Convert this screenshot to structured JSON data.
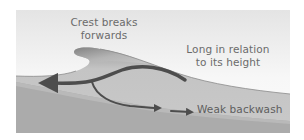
{
  "diagram": {
    "title": "",
    "type": "constructive-wave-cross-section",
    "labels": {
      "crest": [
        "Crest breaks",
        "forwards"
      ],
      "length": [
        "Long in relation",
        "to its height"
      ],
      "backwash": "Weak backwash"
    },
    "colors": {
      "sky_top": "#e6e6e6",
      "sky_bottom": "#fafafa",
      "wave": "#c6c6c6",
      "wave_shadow": "#8c8c8c",
      "seabed": "#a9a9a9",
      "seabed_band": "#b4b4b4",
      "arrow": "#4d4d4d",
      "text": "#6b6b6b"
    },
    "arrows": [
      {
        "name": "swash-return-arrow",
        "direction": "left"
      },
      {
        "name": "backwash-branch-arrow",
        "direction": "right"
      },
      {
        "name": "weak-backwash-arrow",
        "direction": "right"
      }
    ]
  }
}
